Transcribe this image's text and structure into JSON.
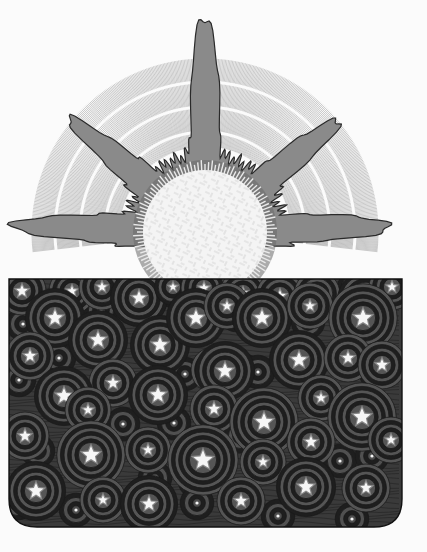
{
  "illustration": {
    "subject": "sun rising above a starry night panel",
    "colors": {
      "background": "#fbfbfb",
      "ray_lines": "#9a9a9a",
      "corona_fill": "#8a8a8a",
      "corona_dark": "#6a6a6a",
      "corona_outline": "#2a2a2a",
      "sun_core": "#f4f4f4",
      "sun_pattern": "#d8d8d8",
      "night_bg": "#3a3a3a",
      "night_rings": "#1e1e1e",
      "star_fill": "#f6f6f6"
    },
    "sun": {
      "cx": 205,
      "cy": 232,
      "core_r": 62,
      "rays_r": 175,
      "spikes": 5
    },
    "panel": {
      "x": 9,
      "y": 279,
      "width": 393,
      "height": 248,
      "corner_radius": 28
    },
    "stars": [
      [
        22,
        291,
        6
      ],
      [
        72,
        291,
        5
      ],
      [
        102,
        287,
        5
      ],
      [
        139,
        298,
        7
      ],
      [
        173,
        287,
        4
      ],
      [
        204,
        288,
        5
      ],
      [
        243,
        293,
        5
      ],
      [
        280,
        296,
        6
      ],
      [
        317,
        294,
        5
      ],
      [
        366,
        300,
        7
      ],
      [
        392,
        287,
        5
      ],
      [
        55,
        318,
        8
      ],
      [
        98,
        340,
        8
      ],
      [
        160,
        345,
        8
      ],
      [
        196,
        318,
        8
      ],
      [
        227,
        306,
        5
      ],
      [
        262,
        318,
        8
      ],
      [
        310,
        306,
        5
      ],
      [
        363,
        318,
        9
      ],
      [
        30,
        356,
        6
      ],
      [
        113,
        383,
        6
      ],
      [
        158,
        395,
        8
      ],
      [
        214,
        370,
        5
      ],
      [
        225,
        371,
        8
      ],
      [
        299,
        360,
        8
      ],
      [
        348,
        358,
        6
      ],
      [
        382,
        365,
        6
      ],
      [
        64,
        396,
        8
      ],
      [
        88,
        410,
        5
      ],
      [
        214,
        409,
        6
      ],
      [
        264,
        422,
        9
      ],
      [
        321,
        398,
        5
      ],
      [
        362,
        417,
        9
      ],
      [
        25,
        436,
        6
      ],
      [
        91,
        455,
        9
      ],
      [
        148,
        450,
        5
      ],
      [
        203,
        460,
        10
      ],
      [
        263,
        462,
        5
      ],
      [
        311,
        442,
        6
      ],
      [
        391,
        440,
        5
      ],
      [
        36,
        491,
        8
      ],
      [
        103,
        500,
        5
      ],
      [
        149,
        504,
        7
      ],
      [
        241,
        501,
        6
      ],
      [
        306,
        487,
        8
      ],
      [
        366,
        488,
        6
      ]
    ],
    "dots": [
      [
        73,
        290
      ],
      [
        101,
        310
      ],
      [
        173,
        291
      ],
      [
        238,
        297
      ],
      [
        294,
        296
      ],
      [
        354,
        288
      ],
      [
        23,
        324
      ],
      [
        59,
        358
      ],
      [
        186,
        316
      ],
      [
        236,
        315
      ],
      [
        256,
        316
      ],
      [
        308,
        322
      ],
      [
        185,
        374
      ],
      [
        245,
        371
      ],
      [
        258,
        372
      ],
      [
        376,
        373
      ],
      [
        19,
        380
      ],
      [
        123,
        424
      ],
      [
        174,
        423
      ],
      [
        241,
        436
      ],
      [
        38,
        451
      ],
      [
        155,
        478
      ],
      [
        195,
        481
      ],
      [
        340,
        461
      ],
      [
        372,
        456
      ],
      [
        76,
        510
      ],
      [
        197,
        503
      ],
      [
        278,
        516
      ],
      [
        352,
        519
      ],
      [
        18,
        503
      ]
    ]
  }
}
